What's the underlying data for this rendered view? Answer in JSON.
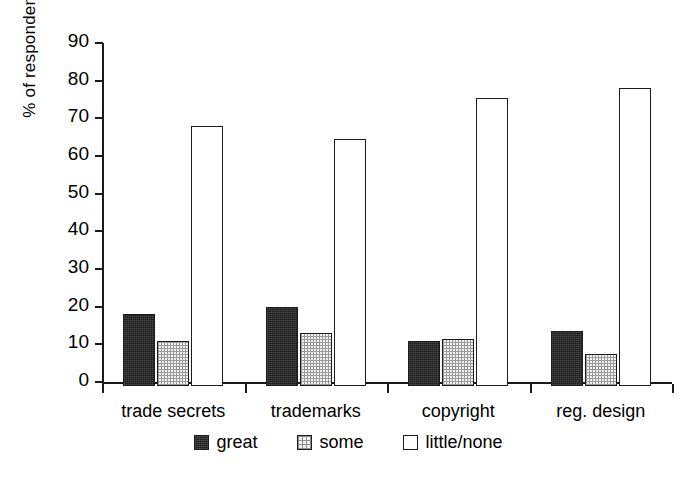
{
  "chart_data": {
    "type": "bar",
    "title": "",
    "xlabel": "",
    "ylabel": "% of respondents",
    "ylim": [
      0,
      90
    ],
    "ytick_step": 10,
    "yticks": [
      "90",
      "80",
      "70",
      "60",
      "50",
      "40",
      "30",
      "20",
      "10",
      "0"
    ],
    "grid": false,
    "legend_position": "bottom-center",
    "categories": [
      "trade secrets",
      "trademarks",
      "copyright",
      "reg. design"
    ],
    "series": [
      {
        "name": "great",
        "swatch": "dark-solid",
        "values": [
          19,
          21,
          12,
          14.5
        ]
      },
      {
        "name": "some",
        "swatch": "light-crosshatch",
        "values": [
          12,
          14,
          12.5,
          8.5
        ]
      },
      {
        "name": "little/none",
        "swatch": "white-empty",
        "values": [
          69,
          65.5,
          76.5,
          79
        ]
      }
    ]
  },
  "axis": {
    "y_title": "% of respondents"
  },
  "legend": {
    "items": [
      {
        "label": "great"
      },
      {
        "label": "some"
      },
      {
        "label": "little/none"
      }
    ]
  },
  "colors": {
    "great": "#1b1b1b",
    "some": "#f2f2f2",
    "little_none": "#ffffff",
    "axis": "#1a1a1a",
    "background": "#ffffff"
  }
}
